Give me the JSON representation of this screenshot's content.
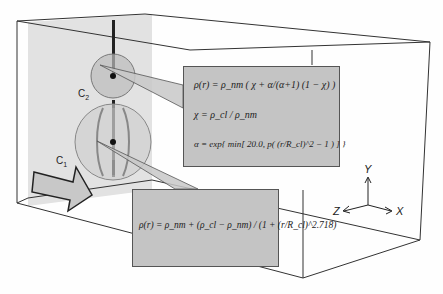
{
  "figure": {
    "labels": {
      "c2": "C",
      "c2_sub": "2",
      "c1": "C",
      "c1_sub": "1"
    },
    "axes": {
      "x": "X",
      "y": "Y",
      "z": "Z"
    },
    "equation_top": {
      "line1": "ρ(r) = ρ_nm ( χ + α/(α+1) (1 − χ) )",
      "line2": "χ = ρ_cl / ρ_nm",
      "line3": "α = exp{ min[ 20.0, p( (r/R_cl)^2 − 1 ) ] }"
    },
    "equation_bottom": {
      "line1": "ρ(r) = ρ_nm + (ρ_cl − ρ_nm) / (1 + (r/R_cl)^2.718)"
    },
    "colors": {
      "panel": "#c4c4c4",
      "side_face": "#e0e0e0",
      "line": "#333333"
    }
  }
}
